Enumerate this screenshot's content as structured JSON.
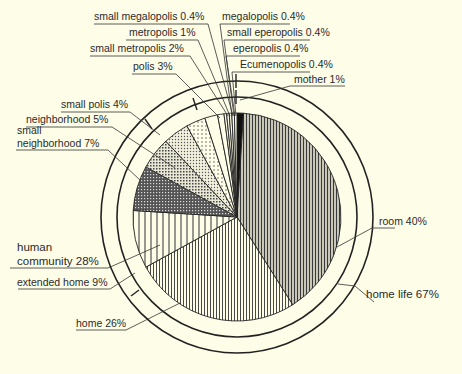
{
  "chart_data": {
    "type": "pie",
    "title": "",
    "center": [
      237,
      217
    ],
    "radius": 104,
    "slices": [
      {
        "label": "mother 1%",
        "value": 1,
        "pattern": "solid-black"
      },
      {
        "label": "room 40%",
        "value": 40,
        "pattern": "fine-vertical-dark"
      },
      {
        "label": "home 26%",
        "value": 26,
        "pattern": "fine-vertical"
      },
      {
        "label": "extended home 9%",
        "value": 9,
        "pattern": "wide-vertical"
      },
      {
        "label": "small neighborhood 7%",
        "value": 7,
        "pattern": "dense-grid"
      },
      {
        "label": "neighborhood 5%",
        "value": 5,
        "pattern": "checker"
      },
      {
        "label": "small polis 4%",
        "value": 4,
        "pattern": "light-dots"
      },
      {
        "label": "polis 3%",
        "value": 3,
        "pattern": "sparse-dots"
      },
      {
        "label": "small metropolis 2%",
        "value": 2,
        "pattern": "blank"
      },
      {
        "label": "metropolis 1%",
        "value": 1,
        "pattern": "blank"
      },
      {
        "label": "small megalopolis 0.4%",
        "value": 0.4,
        "pattern": "blank"
      },
      {
        "label": "megalopolis 0.4%",
        "value": 0.4,
        "pattern": "blank"
      },
      {
        "label": "small eperopolis 0.4%",
        "value": 0.4,
        "pattern": "blank"
      },
      {
        "label": "eperopolis 0.4%",
        "value": 0.4,
        "pattern": "blank"
      },
      {
        "label": "Ecumenopolis 0.4%",
        "value": 0.4,
        "pattern": "blank"
      }
    ],
    "groups": [
      {
        "label": "home life 67%",
        "value": 67,
        "ring": "inner"
      },
      {
        "label": "human community 28%",
        "value": 28,
        "ring": "outer"
      }
    ],
    "legend": "none"
  },
  "labels": {
    "small_megalopolis": "small megalopolis 0.4%",
    "megalopolis": "megalopolis 0.4%",
    "metropolis": "metropolis 1%",
    "small_eperopolis": "small eperopolis 0.4%",
    "small_metropolis": "small metropolis 2%",
    "eperopolis": "eperopolis 0.4%",
    "polis": "polis 3%",
    "ecumenopolis": "Ecumenopolis 0.4%",
    "mother": "mother 1%",
    "small_polis": "small polis 4%",
    "neighborhood": "neighborhood 5%",
    "small_neighborhood_1": "small",
    "small_neighborhood_2": "neighborhood 7%",
    "room": "room 40%",
    "human_community_1": "human",
    "human_community_2": "community 28%",
    "extended_home": "extended home 9%",
    "home_life": "home life 67%",
    "home": "home 26%"
  }
}
